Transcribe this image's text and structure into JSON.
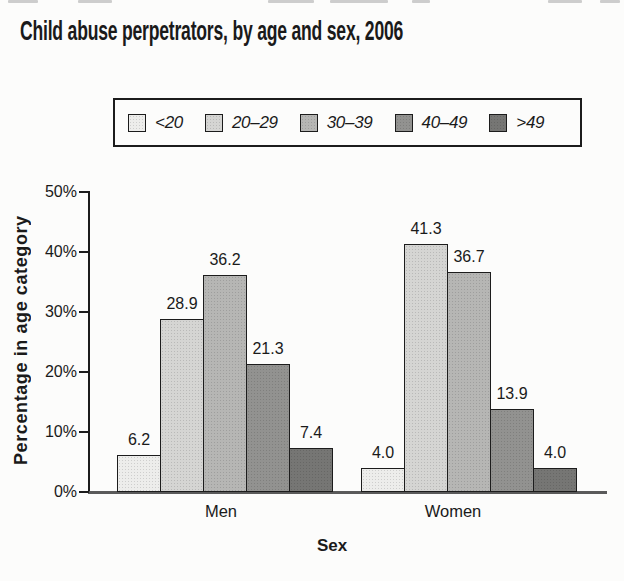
{
  "page": {
    "background": "#fcfcfb",
    "ink": "#1c1c1c"
  },
  "chart_data": {
    "type": "bar",
    "title": "Child abuse perpetrators, by age and sex, 2006",
    "xlabel": "Sex",
    "ylabel": "Percentage in age category",
    "categories": [
      "Men",
      "Women"
    ],
    "series": [
      {
        "name": "<20",
        "values": [
          6.2,
          4.0
        ],
        "color": "#ededeb"
      },
      {
        "name": "20–29",
        "values": [
          28.9,
          41.3
        ],
        "color": "#d5d5d3"
      },
      {
        "name": "30–39",
        "values": [
          36.2,
          36.7
        ],
        "color": "#b6b6b4"
      },
      {
        "name": "40–49",
        "values": [
          21.3,
          13.9
        ],
        "color": "#929290"
      },
      {
        "name": ">49",
        "values": [
          7.4,
          4.0
        ],
        "color": "#767674"
      }
    ],
    "ylim": [
      0,
      50
    ],
    "yticks": [
      "0%",
      "10%",
      "20%",
      "30%",
      "40%",
      "50%"
    ],
    "grid": false,
    "legend_position": "top",
    "value_labels": true
  }
}
